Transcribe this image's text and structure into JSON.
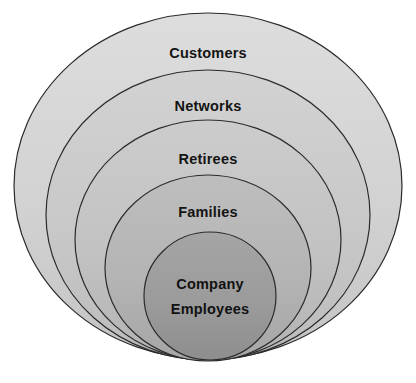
{
  "diagram": {
    "type": "concentric-circles",
    "title": "",
    "background_color": "#ffffff",
    "stroke_color": "#2b2b2b",
    "stroke_width": 1.2,
    "text_color": "#141414",
    "rings": [
      {
        "label": "Customers",
        "level": 1,
        "position": "outermost",
        "fill": "#d4d4d4",
        "cx": 208,
        "cy": 186,
        "rx": 194,
        "ry": 173,
        "label_x": 208,
        "label_y": 53
      },
      {
        "label": "Networks",
        "level": 2,
        "position": "second",
        "fill": "#c9c9c9",
        "cx": 208,
        "cy": 215,
        "rx": 162,
        "ry": 145,
        "label_x": 208,
        "label_y": 106
      },
      {
        "label": "Retirees",
        "level": 3,
        "position": "third",
        "fill": "#c2c2c2",
        "cx": 208,
        "cy": 240,
        "rx": 133,
        "ry": 120,
        "label_x": 208,
        "label_y": 159
      },
      {
        "label": "Families",
        "level": 4,
        "position": "fourth",
        "fill": "#b4b4b4",
        "cx": 208,
        "cy": 268,
        "rx": 103,
        "ry": 93,
        "label_x": 208,
        "label_y": 212
      },
      {
        "label": "Company Employees",
        "label_line_1": "Company",
        "label_line_2": "Employees",
        "level": 5,
        "position": "innermost",
        "fill": "#9b9b9b",
        "cx": 210,
        "cy": 296,
        "rx": 66,
        "ry": 64,
        "label_x": 210,
        "label_y_1": 286,
        "label_y_2": 312
      }
    ]
  }
}
